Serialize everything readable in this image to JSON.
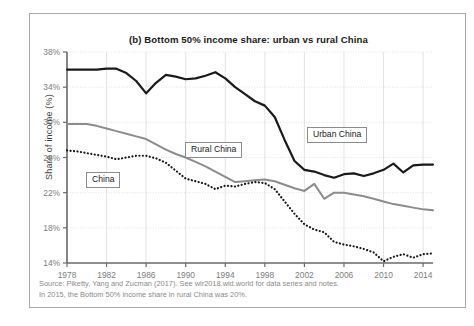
{
  "figure": {
    "title": "(b) Bottom 50% income share: urban vs rural China",
    "y_axis_title": "Share of income (%)",
    "source_line_1": "Source: Piketty, Yang and Zucman (2017). See wir2018.wid.world for data series and notes.",
    "source_line_2": "In 2015, the Bottom 50% income share in rural China was 20%."
  },
  "labels": {
    "china": "China",
    "rural_china": "Rural China",
    "urban_china": "Urban China"
  },
  "colors": {
    "urban_china": "#1a1a1a",
    "rural_china": "#8c8c8c",
    "china": "#1a1a1a",
    "axis": "#6b6b6b",
    "grid": "#dcdcdc",
    "frame": "#a9a9a9",
    "tick_text": "#7d7d7d"
  },
  "chart_data": {
    "type": "line",
    "title": "(b) Bottom 50% income share: urban vs rural China",
    "xlabel": "",
    "ylabel": "Share of income (%)",
    "xlim": [
      1978,
      2015
    ],
    "ylim": [
      14,
      38
    ],
    "ytick_values": [
      14,
      18,
      22,
      26,
      30,
      34,
      38
    ],
    "ytick_labels": [
      "14%",
      "18%",
      "22%",
      "26%",
      "30%",
      "34%",
      "38%"
    ],
    "xtick_values": [
      1978,
      1982,
      1986,
      1990,
      1994,
      1998,
      2002,
      2006,
      2010,
      2014
    ],
    "xtick_labels": [
      "1978",
      "1982",
      "1986",
      "1990",
      "1994",
      "1998",
      "2002",
      "2006",
      "2010",
      "2014"
    ],
    "grid": true,
    "legend": "inline-labels",
    "x": [
      1978,
      1979,
      1980,
      1981,
      1982,
      1983,
      1984,
      1985,
      1986,
      1987,
      1988,
      1989,
      1990,
      1991,
      1992,
      1993,
      1994,
      1995,
      1996,
      1997,
      1998,
      1999,
      2000,
      2001,
      2002,
      2003,
      2004,
      2005,
      2006,
      2007,
      2008,
      2009,
      2010,
      2011,
      2012,
      2013,
      2014,
      2015
    ],
    "series": [
      {
        "name": "Urban China",
        "style": "solid",
        "color": "#1a1a1a",
        "width": 2.2,
        "values": [
          36.0,
          36.0,
          36.0,
          36.0,
          36.1,
          36.1,
          35.6,
          34.7,
          33.3,
          34.5,
          35.4,
          35.2,
          34.9,
          35.0,
          35.3,
          35.7,
          35.0,
          34.0,
          33.2,
          32.4,
          31.9,
          30.6,
          28.0,
          25.6,
          24.6,
          24.4,
          24.0,
          23.7,
          24.1,
          24.2,
          23.9,
          24.2,
          24.6,
          25.3,
          24.3,
          25.1,
          25.2,
          25.2
        ]
      },
      {
        "name": "Rural China",
        "style": "solid",
        "color": "#8c8c8c",
        "width": 2.0,
        "values": [
          29.8,
          29.8,
          29.8,
          29.6,
          29.3,
          29.0,
          28.7,
          28.4,
          28.1,
          27.5,
          26.9,
          26.4,
          26.0,
          25.5,
          25.0,
          24.4,
          23.8,
          23.2,
          23.3,
          23.4,
          23.5,
          23.3,
          22.9,
          22.5,
          22.2,
          23.0,
          21.3,
          22.0,
          22.0,
          21.8,
          21.6,
          21.3,
          21.0,
          20.7,
          20.5,
          20.3,
          20.1,
          20.0
        ]
      },
      {
        "name": "China",
        "style": "dotted",
        "color": "#1a1a1a",
        "width": 2.2,
        "values": [
          26.8,
          26.7,
          26.5,
          26.3,
          26.1,
          25.8,
          26.0,
          26.2,
          26.2,
          25.9,
          25.4,
          24.5,
          23.6,
          23.3,
          23.0,
          22.4,
          22.8,
          22.7,
          23.0,
          23.2,
          23.1,
          22.4,
          21.0,
          19.6,
          18.4,
          17.8,
          17.5,
          16.4,
          16.1,
          15.9,
          15.6,
          15.2,
          14.2,
          14.7,
          15.0,
          14.6,
          15.0,
          15.1
        ]
      }
    ]
  }
}
